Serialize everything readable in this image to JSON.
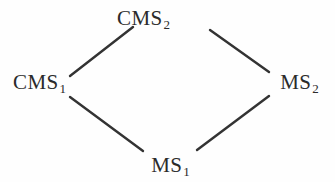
{
  "diagram": {
    "type": "hasse-diagram",
    "background_color": "#fefefe",
    "edge_color": "#333333",
    "text_color": "#2b2b2b",
    "nodes": [
      {
        "id": "top",
        "base": "CMS",
        "subscript": "2",
        "label": "CMS2",
        "x": 143,
        "y": 18
      },
      {
        "id": "left",
        "base": "CMS",
        "subscript": "1",
        "label": "CMS1",
        "x": 39,
        "y": 83
      },
      {
        "id": "right",
        "base": "MS",
        "subscript": "2",
        "label": "MS2",
        "x": 299,
        "y": 83
      },
      {
        "id": "bottom",
        "base": "MS",
        "subscript": "1",
        "label": "MS1",
        "x": 170,
        "y": 165
      }
    ],
    "edges": [
      {
        "id": "left-top",
        "from": "left",
        "to": "top",
        "x1": 70,
        "y1": 76,
        "x2": 133,
        "y2": 27
      },
      {
        "id": "top-right",
        "from": "top",
        "to": "right",
        "x1": 210,
        "y1": 30,
        "x2": 269,
        "y2": 72
      },
      {
        "id": "left-bottom",
        "from": "left",
        "to": "bottom",
        "x1": 70,
        "y1": 97,
        "x2": 143,
        "y2": 151
      },
      {
        "id": "bottom-right",
        "from": "bottom",
        "to": "right",
        "x1": 197,
        "y1": 150,
        "x2": 269,
        "y2": 96
      }
    ]
  }
}
